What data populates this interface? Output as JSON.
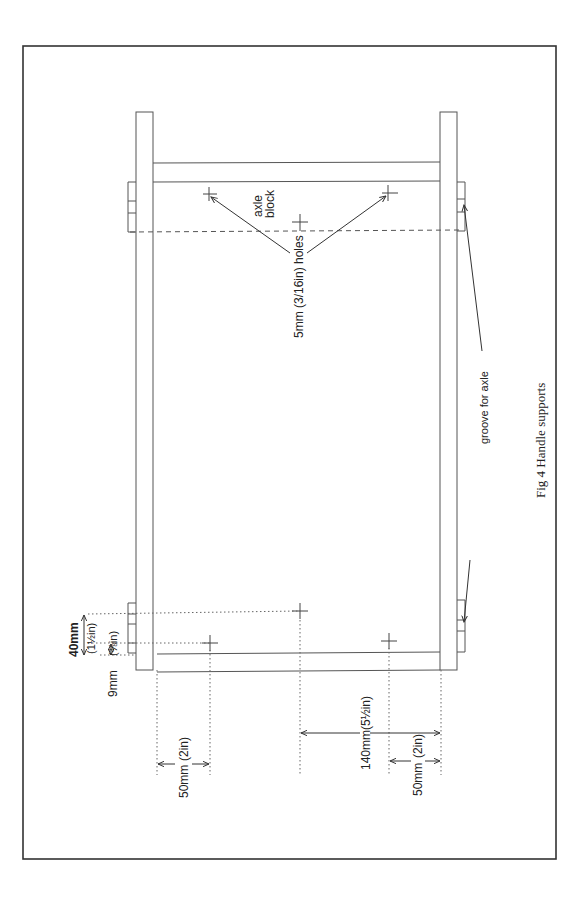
{
  "figure": {
    "caption": "Fig 4 Handle supports",
    "stroke_color": "#555555",
    "border_color": "#333333"
  },
  "labels": {
    "axle_block_line1": "axle",
    "axle_block_line2": "block",
    "holes": "5mm (3/16in) holes",
    "groove": "groove for axle"
  },
  "dimensions": {
    "d40": {
      "metric": "40mm",
      "imperial": "(1½in)"
    },
    "d9": {
      "metric": "9mm",
      "imperial": "(⅜in)"
    },
    "d50_left": {
      "metric": "50mm",
      "imperial": "(2in)"
    },
    "d140": {
      "metric": "140mm",
      "imperial": "(5½in)"
    },
    "d50_right": {
      "metric": "50mm",
      "imperial": "(2in)"
    }
  }
}
